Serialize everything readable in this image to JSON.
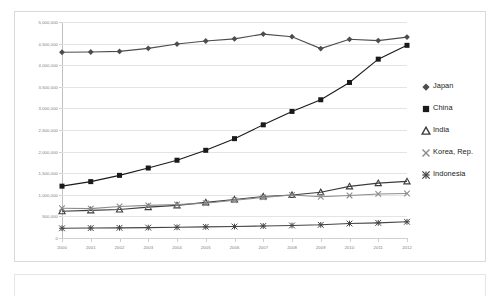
{
  "chart_data": {
    "type": "line",
    "title": "",
    "subtitle": "",
    "xlabel": "",
    "ylabel": "",
    "grid": true,
    "legend_position": "right",
    "xlim": [
      2000,
      2012
    ],
    "ylim": [
      0,
      5000000
    ],
    "x": [
      2000,
      2001,
      2002,
      2003,
      2004,
      2005,
      2006,
      2007,
      2008,
      2009,
      2010,
      2011,
      2012
    ],
    "categories": [
      "2000",
      "2001",
      "2002",
      "2003",
      "2004",
      "2005",
      "2006",
      "2007",
      "2008",
      "2009",
      "2010",
      "2011",
      "2012"
    ],
    "ytick_values": [
      0,
      500000,
      1000000,
      1500000,
      2000000,
      2500000,
      3000000,
      3500000,
      4000000,
      4500000,
      5000000
    ],
    "ytick_labels": [
      "0",
      "500,000",
      "1,000,000",
      "1,500,000",
      "2,000,000",
      "2,500,000",
      "3,000,000",
      "3,500,000",
      "4,000,000",
      "4,500,000",
      "5,000,000"
    ],
    "series": [
      {
        "name": "Japan",
        "marker": "diamond",
        "color": "#4d4d4d",
        "values": [
          4300000,
          4305000,
          4320000,
          4390000,
          4490000,
          4560000,
          4610000,
          4720000,
          4660000,
          4385000,
          4600000,
          4570000,
          4650000
        ]
      },
      {
        "name": "China",
        "marker": "square",
        "color": "#1a1a1a",
        "values": [
          1200000,
          1305000,
          1450000,
          1620000,
          1800000,
          2030000,
          2300000,
          2620000,
          2930000,
          3200000,
          3600000,
          4140000,
          4460000
        ]
      },
      {
        "name": "India",
        "marker": "triangle",
        "color": "#3d3d3d",
        "values": [
          620000,
          640000,
          660000,
          715000,
          755000,
          825000,
          890000,
          960000,
          995000,
          1060000,
          1195000,
          1270000,
          1310000
        ]
      },
      {
        "name": "Korea, Rep.",
        "marker": "cross",
        "color": "#8c8c8c",
        "values": [
          690000,
          680000,
          730000,
          755000,
          775000,
          805000,
          875000,
          940000,
          995000,
          955000,
          985000,
          1020000,
          1030000
        ]
      },
      {
        "name": "Indonesia",
        "marker": "asterisk",
        "color": "#454545",
        "values": [
          225000,
          230000,
          235000,
          240000,
          248000,
          258000,
          265000,
          278000,
          290000,
          305000,
          335000,
          350000,
          375000
        ]
      }
    ]
  },
  "legend": {
    "entries": [
      {
        "label": "Japan"
      },
      {
        "label": "China"
      },
      {
        "label": "India"
      },
      {
        "label": "Korea, Rep."
      },
      {
        "label": "Indonesia"
      }
    ]
  }
}
